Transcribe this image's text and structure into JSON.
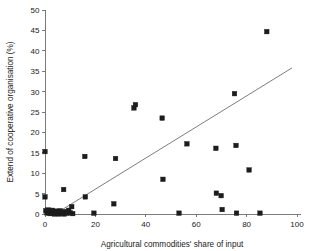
{
  "chart_data": {
    "type": "scatter",
    "title": "",
    "xlabel": "Agricultural commodities' share of input",
    "ylabel": "Extend of cooperative organisation (%)",
    "xlim": [
      0,
      100
    ],
    "ylim": [
      0,
      50
    ],
    "xticks": [
      0,
      20,
      40,
      60,
      80,
      100
    ],
    "yticks": [
      0,
      5,
      10,
      15,
      20,
      25,
      30,
      35,
      40,
      45,
      50
    ],
    "xtick_labels": [
      "0",
      "20",
      "40",
      "60",
      "80",
      "100"
    ],
    "ytick_labels": [
      "0",
      "5",
      "10",
      "15",
      "20",
      "25",
      "30",
      "35",
      "40",
      "45",
      "50"
    ],
    "grid": false,
    "legend": null,
    "marker": "square",
    "marker_color": "#1c1c1c",
    "series": [
      {
        "name": "observations",
        "points": [
          [
            0.0,
            15.3
          ],
          [
            0.0,
            4.2
          ],
          [
            0.3,
            0.8
          ],
          [
            0.8,
            0.3
          ],
          [
            1.2,
            1.0
          ],
          [
            1.6,
            0.2
          ],
          [
            2.0,
            0.6
          ],
          [
            2.4,
            0.1
          ],
          [
            2.9,
            0.9
          ],
          [
            3.3,
            0.3
          ],
          [
            3.8,
            0.0
          ],
          [
            4.2,
            0.7
          ],
          [
            4.7,
            0.2
          ],
          [
            5.1,
            0.5
          ],
          [
            5.6,
            0.0
          ],
          [
            6.0,
            0.8
          ],
          [
            6.5,
            0.2
          ],
          [
            6.9,
            0.4
          ],
          [
            7.4,
            6.0
          ],
          [
            7.6,
            0.0
          ],
          [
            8.2,
            0.6
          ],
          [
            8.8,
            0.2
          ],
          [
            9.4,
            0.9
          ],
          [
            10.0,
            0.3
          ],
          [
            10.6,
            1.8
          ],
          [
            11.0,
            0.1
          ],
          [
            15.8,
            14.1
          ],
          [
            16.0,
            4.2
          ],
          [
            19.4,
            0.2
          ],
          [
            27.3,
            2.5
          ],
          [
            28.0,
            13.6
          ],
          [
            35.3,
            26.0
          ],
          [
            35.9,
            26.8
          ],
          [
            46.5,
            23.5
          ],
          [
            46.8,
            8.5
          ],
          [
            53.2,
            0.2
          ],
          [
            56.3,
            17.2
          ],
          [
            67.8,
            16.1
          ],
          [
            68.0,
            5.1
          ],
          [
            69.9,
            4.5
          ],
          [
            70.3,
            1.1
          ],
          [
            75.2,
            29.5
          ],
          [
            75.8,
            16.8
          ],
          [
            76.0,
            0.2
          ],
          [
            81.0,
            10.8
          ],
          [
            85.3,
            0.2
          ],
          [
            88.0,
            44.7
          ]
        ]
      }
    ],
    "trendline": {
      "name": "linear fit",
      "x_start": 4.0,
      "y_start": 0.0,
      "x_end": 98.0,
      "y_end": 35.8,
      "color": "#6e6e6e"
    }
  }
}
